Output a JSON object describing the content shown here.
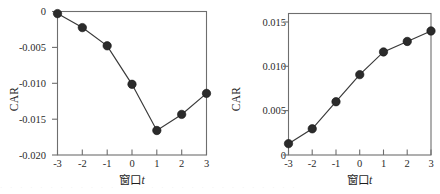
{
  "figure": {
    "background": "#ffffff",
    "marker_color": "#2b2b2b",
    "line_color": "#3a3a3a",
    "axis_color": "#6e6e6e"
  },
  "chart_data": [
    {
      "type": "line",
      "panel": "left",
      "title": "",
      "xlabel": "窗口t",
      "xlabel_main": "窗口",
      "xlabel_italic": "t",
      "ylabel": "CAR",
      "x": [
        -3,
        -2,
        -1,
        0,
        1,
        2,
        3
      ],
      "values": [
        0.0002,
        -0.0018,
        -0.0044,
        -0.0099,
        -0.0165,
        -0.0142,
        -0.0112
      ],
      "xticklabels": [
        "-3",
        "-2",
        "-1",
        "0",
        "1",
        "2",
        "3"
      ],
      "yticks": [
        0,
        -0.005,
        -0.01,
        -0.015,
        -0.02
      ],
      "yticklabels": [
        "0",
        "-0.005",
        "-0.010",
        "-0.015",
        "-0.020"
      ],
      "xlim": [
        -3,
        3
      ],
      "ylim": [
        -0.02,
        0.0005
      ],
      "grid": false,
      "legend": "none",
      "frame": "box",
      "marker": "filled-circle"
    },
    {
      "type": "line",
      "panel": "right",
      "title": "",
      "xlabel": "窗口t",
      "xlabel_main": "窗口",
      "xlabel_italic": "t",
      "ylabel": "CAR",
      "x": [
        -3,
        -2,
        -1,
        0,
        1,
        2,
        3
      ],
      "values": [
        0.0013,
        0.003,
        0.0061,
        0.0092,
        0.0118,
        0.013,
        0.0142
      ],
      "xticklabels": [
        "-3",
        "-2",
        "-1",
        "0",
        "1",
        "2",
        "3"
      ],
      "yticks": [
        0,
        0.005,
        0.01,
        0.015
      ],
      "yticklabels": [
        "0",
        "0.005",
        "0.010",
        "0.015"
      ],
      "xlim": [
        -3,
        3
      ],
      "ylim": [
        0,
        0.0162
      ],
      "grid": false,
      "legend": "none",
      "frame": "box",
      "marker": "filled-circle"
    }
  ],
  "footer": {
    "smudge_text": "· · · · · · · · · · · · · · · · · · · · · · · · · · · · · ·"
  }
}
